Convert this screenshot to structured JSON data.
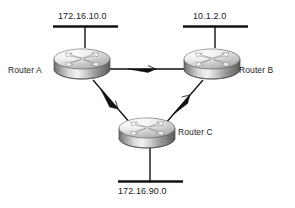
{
  "diagram": {
    "type": "network-topology",
    "background_color": "#ffffff",
    "line_color": "#111111",
    "text_color": "#1a1a1a",
    "networks": [
      {
        "id": "lan-top-left",
        "label": "172.16.10.0",
        "attached_to": "Router A",
        "position": "top-left"
      },
      {
        "id": "lan-top-right",
        "label": "10.1.2.0",
        "attached_to": "Router B",
        "position": "top-right"
      },
      {
        "id": "lan-bottom",
        "label": "172.16.90.0",
        "attached_to": "Router C",
        "position": "bottom"
      }
    ],
    "routers": [
      {
        "id": "router-a",
        "label": "Router A",
        "label_side": "left",
        "x": 82,
        "y": 62
      },
      {
        "id": "router-b",
        "label": "Router B",
        "label_side": "right",
        "x": 212,
        "y": 62
      },
      {
        "id": "router-c",
        "label": "Router C",
        "label_side": "right",
        "x": 147,
        "y": 132
      }
    ],
    "links": [
      {
        "id": "link-a-b",
        "from": "Router A",
        "to": "Router B",
        "direction": "a-to-b",
        "arrow": "mid-right"
      },
      {
        "id": "link-a-c",
        "from": "Router A",
        "to": "Router C",
        "direction": "a-to-c",
        "arrow": "mid-down-right"
      },
      {
        "id": "link-c-b",
        "from": "Router C",
        "to": "Router B",
        "direction": "c-to-b",
        "arrow": "mid-up-right"
      }
    ],
    "icons": {
      "router": "router-icon",
      "lan-segment": "lan-segment-icon",
      "arrow": "arrow-icon"
    }
  }
}
